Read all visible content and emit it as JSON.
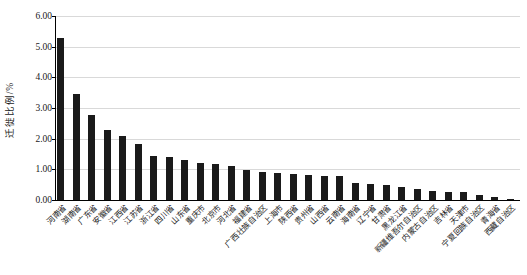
{
  "chart_data": {
    "type": "bar",
    "title": "",
    "xlabel": "",
    "ylabel": "迁徙比例/%",
    "ylim": [
      0,
      6
    ],
    "grid": true,
    "legend": false,
    "bar_color": "#1a1a1a",
    "gridline_color": "#d9d9d9",
    "axis_color": "#000000",
    "ytick_labels": [
      "0.00",
      "1.00",
      "2.00",
      "3.00",
      "4.00",
      "5.00",
      "6.00"
    ],
    "categories": [
      "河南省",
      "湖南省",
      "广东省",
      "安徽省",
      "江西省",
      "江苏省",
      "浙江省",
      "四川省",
      "山东省",
      "重庆市",
      "北京市",
      "河北省",
      "福建省",
      "广西壮族自治区",
      "上海市",
      "陕西省",
      "贵州省",
      "山西省",
      "云南省",
      "海南省",
      "辽宁省",
      "甘肃省",
      "黑龙江省",
      "新疆维吾尔自治区",
      "内蒙古自治区",
      "吉林省",
      "天津市",
      "宁夏回族自治区",
      "青海省",
      "西藏自治区"
    ],
    "values": [
      5.29,
      3.47,
      2.76,
      2.28,
      2.08,
      1.83,
      1.45,
      1.4,
      1.32,
      1.21,
      1.18,
      1.1,
      0.98,
      0.92,
      0.88,
      0.86,
      0.82,
      0.79,
      0.77,
      0.56,
      0.53,
      0.5,
      0.42,
      0.36,
      0.28,
      0.27,
      0.25,
      0.16,
      0.09,
      0.03
    ]
  }
}
